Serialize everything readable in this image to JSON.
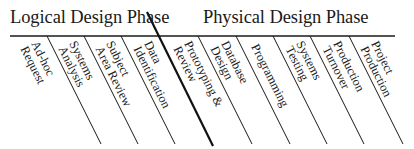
{
  "diagram": {
    "phases": [
      {
        "label": "Logical Design Phase"
      },
      {
        "label": "Physical Design Phase"
      }
    ],
    "divider": {
      "description": "thick diagonal line separating logical and physical phases",
      "between_steps": [
        "Subject Area Review",
        "Data Identification"
      ]
    },
    "steps": [
      {
        "lines": [
          "Ad-hoc",
          "Request"
        ],
        "phase": "Logical Design Phase"
      },
      {
        "lines": [
          "Systems",
          "Analysis"
        ],
        "phase": "Logical Design Phase"
      },
      {
        "lines": [
          "Subject",
          "Area Review"
        ],
        "phase": "Logical Design Phase"
      },
      {
        "lines": [
          "Data",
          "Identification"
        ],
        "phase": "Logical Design Phase"
      },
      {
        "lines": [
          "Prototyping &",
          "Review"
        ],
        "phase": "Physical Design Phase"
      },
      {
        "lines": [
          "Database",
          "Design"
        ],
        "phase": "Physical Design Phase"
      },
      {
        "lines": [
          "Programming"
        ],
        "phase": "Physical Design Phase"
      },
      {
        "lines": [
          "Systems",
          "Testing"
        ],
        "phase": "Physical Design Phase"
      },
      {
        "lines": [
          "Production",
          "Turnover"
        ],
        "phase": "Physical Design Phase"
      },
      {
        "lines": [
          "Project",
          "Production"
        ],
        "phase": "Physical Design Phase"
      }
    ],
    "colors": {
      "line": "#1a1a1a",
      "text": "#1a1a1a",
      "background": "#ffffff"
    }
  }
}
